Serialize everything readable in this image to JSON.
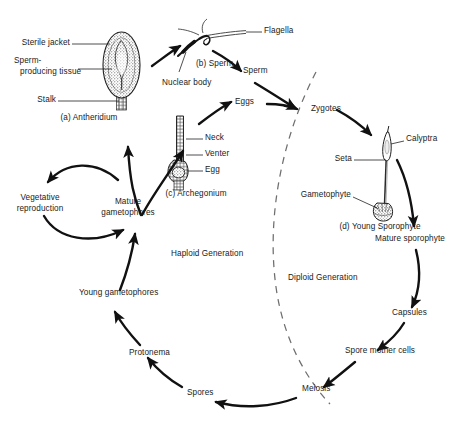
{
  "diagram": {
    "background_color": "#ffffff",
    "ink_color": "#111111",
    "generations": {
      "haploid_label": "Haploid Generation",
      "diploid_label": "Diploid Generation",
      "divider_style": "dashed"
    },
    "structures": [
      {
        "id": "antheridium",
        "caption": "(a) Antheridium",
        "parts": [
          "Sterile jacket",
          "Sperm-producing tissue",
          "Stalk"
        ]
      },
      {
        "id": "sperm",
        "caption": "(b) Sperm",
        "parts": [
          "Flagella",
          "Nuclear body"
        ]
      },
      {
        "id": "archegonium",
        "caption": "(c) Archegonium",
        "parts": [
          "Neck",
          "Venter",
          "Egg"
        ]
      },
      {
        "id": "young-sporophyte",
        "caption": "(d) Young Sporophyte",
        "parts": [
          "Calyptra",
          "Seta",
          "Gametophyte"
        ]
      }
    ],
    "labels": {
      "sterile_jacket": "Sterile jacket",
      "sperm_producing_line1": "Sperm-",
      "sperm_producing_line2": "producing tissue",
      "stalk": "Stalk",
      "antheridium_caption": "(a) Antheridium",
      "flagella": "Flagella",
      "sperm_caption": "(b) Sperm",
      "nuclear_body": "Nuclear body",
      "sperm_node": "Sperm",
      "eggs_node": "Eggs",
      "zygotes_node": "Zygotes",
      "neck": "Neck",
      "venter": "Venter",
      "egg": "Egg",
      "archegonium_caption": "(c) Archegonium",
      "calyptra": "Calyptra",
      "seta": "Seta",
      "gametophyte": "Gametophyte",
      "young_sporophyte_caption": "(d) Young Sporophyte",
      "mature_sporophyte": "Mature sporophyte",
      "capsules": "Capsules",
      "spore_mother_cells": "Spore mother cells",
      "meiosis": "Meiosis",
      "spores": "Spores",
      "protonema": "Protonema",
      "young_gametophores": "Young gametophores",
      "mature_gametophores_line1": "Mature",
      "mature_gametophores_line2": "gametophores",
      "vegetative_reproduction_line1": "Vegetative",
      "vegetative_reproduction_line2": "reproduction",
      "haploid_generation": "Haploid Generation",
      "diploid_generation": "Diploid Generation"
    },
    "cycle_nodes": [
      "Mature gametophores",
      "Antheridium",
      "Sperm",
      "Archegonium",
      "Eggs",
      "Zygotes",
      "Young Sporophyte",
      "Mature sporophyte",
      "Capsules",
      "Spore mother cells",
      "Meiosis",
      "Spores",
      "Protonema",
      "Young gametophores",
      "Vegetative reproduction"
    ]
  }
}
